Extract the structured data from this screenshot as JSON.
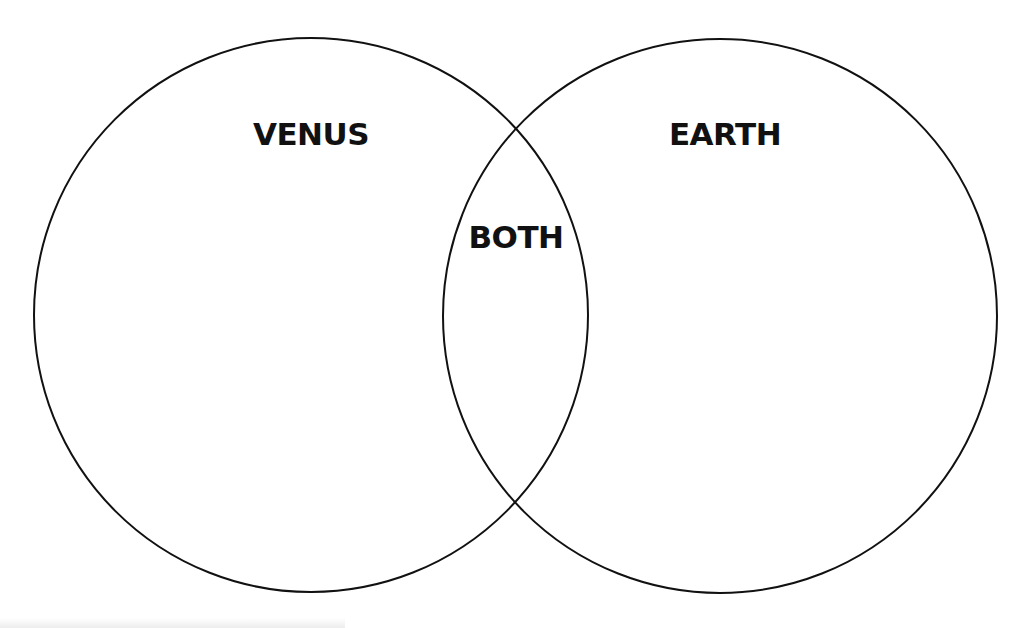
{
  "diagram": {
    "type": "venn",
    "sets": [
      {
        "id": "left",
        "label": "VENUS",
        "cx": 311,
        "cy": 315,
        "r": 277
      },
      {
        "id": "right",
        "label": "EARTH",
        "cx": 720,
        "cy": 316,
        "r": 277
      }
    ],
    "intersection": {
      "label": "BOTH"
    },
    "stroke_color": "#111111",
    "background_color": "#ffffff"
  },
  "labels": {
    "left": "VENUS",
    "right": "EARTH",
    "overlap": "BOTH"
  }
}
